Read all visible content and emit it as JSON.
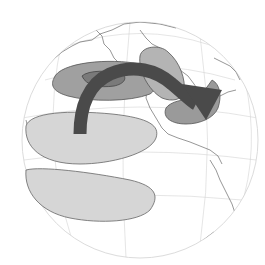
{
  "diagram": {
    "type": "globe-teleconnection",
    "colors": {
      "background": "#ffffff",
      "globe_outline": "#d8d8d8",
      "graticule": "#d0d0d0",
      "coastline": "#555555",
      "dark_anomaly": "#8e8e8e",
      "medium_anomaly": "#a6a6a6",
      "light_anomaly": "#d4d4d4",
      "core_anomaly": "#6f6f6f",
      "arrow": "#4a4a4a",
      "outline": "#555555"
    },
    "regions": [
      {
        "name": "north-pacific-low",
        "shade": "dark"
      },
      {
        "name": "north-pacific-core",
        "shade": "core"
      },
      {
        "name": "canada-high",
        "shade": "medium"
      },
      {
        "name": "southeast-us-low",
        "shade": "dark"
      },
      {
        "name": "tropical-pacific-north",
        "shade": "light"
      },
      {
        "name": "tropical-pacific-south",
        "shade": "light"
      }
    ],
    "arrow": {
      "from": "tropical-pacific",
      "to": "southeast-us"
    }
  }
}
